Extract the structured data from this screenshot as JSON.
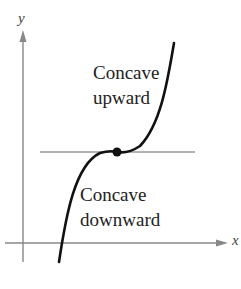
{
  "diagram": {
    "axes": {
      "x_label": "x",
      "y_label": "y"
    },
    "labels": {
      "upper_line1": "Concave",
      "upper_line2": "upward",
      "lower_line1": "Concave",
      "lower_line2": "downward"
    },
    "inflection_point": {
      "description": "point of inflection with horizontal tangent line"
    },
    "colors": {
      "axis": "#888888",
      "curve": "#111111",
      "tangent": "#999999"
    }
  }
}
